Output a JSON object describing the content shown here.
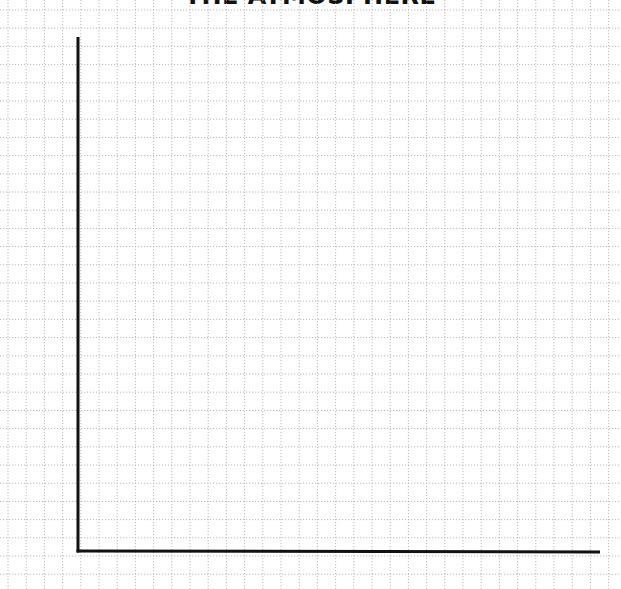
{
  "chart_data": {
    "type": "line",
    "title": "THE ATMOSPHERE",
    "xlabel": "",
    "ylabel": "",
    "series": [],
    "categories": [],
    "grid": true,
    "grid_style": "dotted",
    "legend": null,
    "note": "Blank graph template: dotted square grid with an empty L-shaped x/y axis; no data plotted, no tick labels."
  },
  "colors": {
    "grid": "#a8a8a8",
    "axis": "#111111",
    "background": "#ffffff",
    "title": "#111111"
  },
  "layout": {
    "grid_origin_x": 8,
    "grid_origin_y": 10,
    "grid_step": 18.2,
    "axis_origin": [
      78,
      551
    ],
    "y_axis_top": 37,
    "x_axis_end": 600
  }
}
